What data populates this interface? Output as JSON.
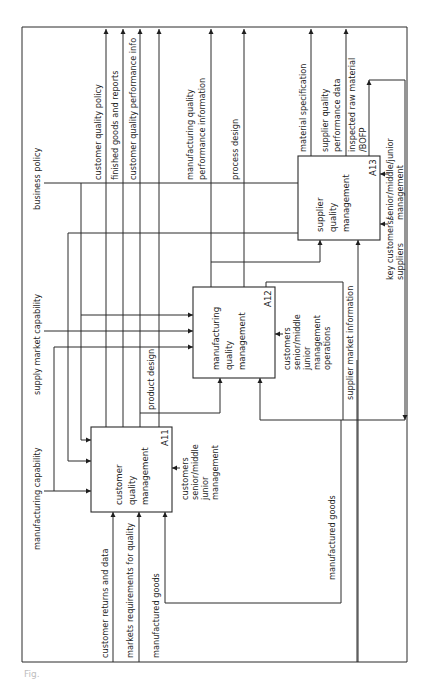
{
  "diagram": {
    "type": "IDEF0 activity diagram (rotated 90 degrees)",
    "outer_left_labels": {
      "business_policy": "business policy",
      "supply_market_capability": "supply market capability",
      "manufacturing_capability": "manufacturing capability"
    },
    "top_outputs": {
      "customer_quality_policy": "customer quality policy",
      "finished_goods_and_reports": "finished goods and reports",
      "customer_quality_performance_info": "customer quality performance info",
      "manufacturing_quality_performance_information_1": "manufacturing quality",
      "manufacturing_quality_performance_information_2": "performance information",
      "process_design": "process design",
      "material_specification": "material specification",
      "supplier_quality_performance_data_1": "supplier quality",
      "supplier_quality_performance_data_2": "performance data",
      "inspected_raw_material_1": "inspected raw material",
      "inspected_raw_material_2": "/BOFP"
    },
    "bottom_inputs": {
      "customer_returns_and_data": "customer returns and data",
      "markets_requirements_for_quality": "markets requirements for quality",
      "manufactured_goods": "manufactured goods"
    },
    "internal_labels": {
      "product_design": "product design",
      "supplier_market_information": "supplier market information",
      "manufactured_goods_loop": "manufactured goods"
    },
    "boxes": [
      {
        "id": "A11",
        "name_lines": [
          "customer",
          "quality",
          "management"
        ],
        "mechanism_lines": [
          "customers",
          "senior/middle",
          "junior",
          "management"
        ]
      },
      {
        "id": "A12",
        "name_lines": [
          "manufacturing",
          "quality",
          "management"
        ],
        "mechanism_lines": [
          "customers",
          "senior/middle",
          "junior",
          "management",
          "operations"
        ]
      },
      {
        "id": "A13",
        "name_lines": [
          "supplier",
          "quality",
          "management"
        ],
        "mechanism_lines_a": [
          "senior/middle/junior",
          "management"
        ],
        "mechanism_lines_b": [
          "key customers/",
          "suppliers"
        ]
      }
    ],
    "caption": "Fig."
  }
}
